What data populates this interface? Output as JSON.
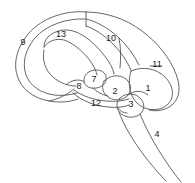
{
  "figure": {
    "type": "anatomical-line-diagram",
    "width": 195,
    "height": 183,
    "background_color": "#ffffff",
    "stroke_color": "#555555",
    "label_color": "#1a1a1a",
    "label_font_size_px": 9
  },
  "labels": [
    {
      "id": "label-1",
      "text": "1",
      "x": 148,
      "y": 88
    },
    {
      "id": "label-2",
      "text": "2",
      "x": 115,
      "y": 91
    },
    {
      "id": "label-3",
      "text": "3",
      "x": 131,
      "y": 104
    },
    {
      "id": "label-4",
      "text": "4",
      "x": 157,
      "y": 134
    },
    {
      "id": "label-7",
      "text": "7",
      "x": 94,
      "y": 79
    },
    {
      "id": "label-8",
      "text": "8",
      "x": 79,
      "y": 86
    },
    {
      "id": "label-9",
      "text": "9",
      "x": 23,
      "y": 42
    },
    {
      "id": "label-10",
      "text": "10",
      "x": 111,
      "y": 38
    },
    {
      "id": "label-11",
      "text": "11",
      "x": 157,
      "y": 64
    },
    {
      "id": "label-12",
      "text": "12",
      "x": 96,
      "y": 103
    },
    {
      "id": "label-13",
      "text": "13",
      "x": 61,
      "y": 34
    }
  ]
}
